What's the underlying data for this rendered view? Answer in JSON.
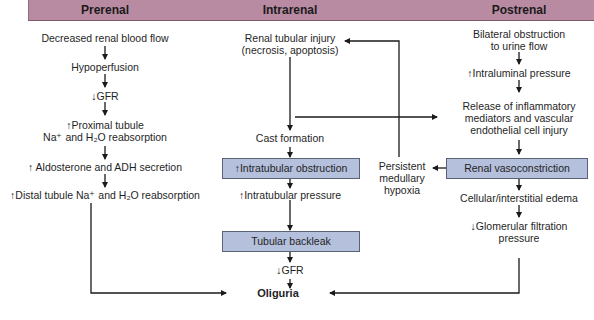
{
  "header": {
    "columns": [
      {
        "label": "Prerenal",
        "x": 105
      },
      {
        "label": "Intrarenal",
        "x": 290
      },
      {
        "label": "Postrenal",
        "x": 519
      }
    ],
    "color": "#b88ba2"
  },
  "prerenal": {
    "steps": [
      "Decreased renal blood flow",
      "Hypoperfusion",
      "↓GFR",
      "↑Proximal tubule",
      "Na⁺ and H₂O reabsorption",
      "↑ Aldosterone and ADH secretion",
      "↑Distal tubule Na⁺ and H₂O reabsorption"
    ]
  },
  "intrarenal": {
    "injury_line1": "Renal tubular injury",
    "injury_line2": "(necrosis, apoptosis)",
    "cast_formation": "Cast formation",
    "obstruction_box": "↑Intratubular obstruction",
    "pressure": "↑Intratubular pressure",
    "backleak_box": "Tubular backleak",
    "gfr": "↓GFR"
  },
  "feedback": {
    "line1": "Persistent",
    "line2": "medullary",
    "line3": "hypoxia"
  },
  "postrenal": {
    "obstruction_line1": "Bilateral obstruction",
    "obstruction_line2": "to urine flow",
    "intraluminal": "↑Intraluminal pressure",
    "release_line1": "Release of inflammatory",
    "release_line2": "mediators and vascular",
    "release_line3": "endothelial cell injury",
    "vasoconstriction_box": "Renal vasoconstriction",
    "edema": "Cellular/interstitial edema",
    "gfp_line1": "↓Glomerular filtration",
    "gfp_line2": "pressure"
  },
  "outcome": {
    "label": "Oliguria"
  },
  "colors": {
    "box_fill": "#b4c0dc",
    "box_border": "#5a6275",
    "arrow": "#1a1a1a"
  }
}
